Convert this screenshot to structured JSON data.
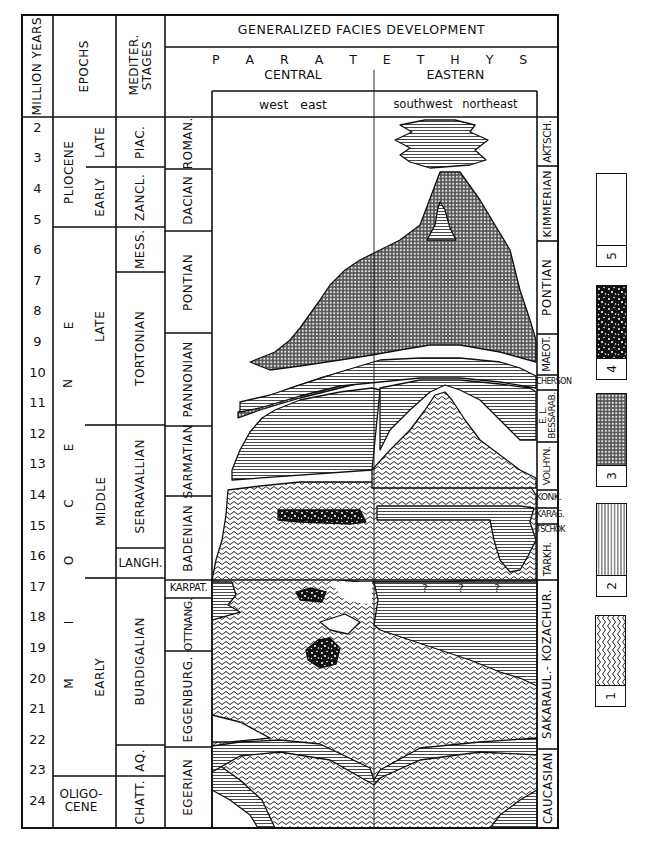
{
  "header": {
    "million_years": "MILLION YEARS",
    "epochs": "EPOCHS",
    "mediter_stages": "MEDITER. STAGES",
    "title": "GENERALIZED FACIES DEVELOPMENT",
    "paratethys": "P A R A T E T H Y S",
    "central": "CENTRAL",
    "eastern": "EASTERN",
    "central_direction": "west east",
    "eastern_direction": "southwest northeast"
  },
  "million_years": [
    "2",
    "3",
    "4",
    "5",
    "6",
    "7",
    "8",
    "9",
    "10",
    "11",
    "12",
    "13",
    "14",
    "15",
    "16",
    "17",
    "18",
    "19",
    "20",
    "21",
    "22",
    "23",
    "24"
  ],
  "epochs": {
    "pliocene": "PLIOCENE",
    "pliocene_late": "LATE",
    "pliocene_early": "EARLY",
    "miocene_letters": [
      "E",
      "N",
      "E",
      "C",
      "O",
      "I",
      "M"
    ],
    "miocene_late": "LATE",
    "miocene_middle": "MIDDLE",
    "miocene_early": "EARLY",
    "oligocene": "OLIGO-CENE"
  },
  "mediterranean_stages": [
    "PIAC.",
    "ZANCL.",
    "MESS.",
    "TORTONIAN",
    "SERRAVALLIAN",
    "LANGH.",
    "BURDIGALIAN",
    "AQ.",
    "CHATT."
  ],
  "central_paratethys_stages": [
    "ROMAN.",
    "DACIAN",
    "PONTIAN",
    "PANNONIAN",
    "SARMATIAN",
    "BADENIAN",
    "KARPAT.",
    "OTTNANG.",
    "EGGENBURG.",
    "EGERIAN"
  ],
  "eastern_paratethys_stages": [
    "AKTSCH.",
    "KIMMERIAN",
    "PONTIAN",
    "MAEOT.",
    "CHERSON",
    "E. L. BESSARAB.",
    "VOLHYN.",
    "KONK.",
    "KARAG.",
    "TSCHOK",
    "TARKH.",
    "SAKARAUL.- KOZACHUR.",
    "CAUCASIAN"
  ],
  "chart_annotations": {
    "question_marks": [
      "?",
      "?",
      "?"
    ]
  },
  "legend": [
    {
      "id": "5",
      "pattern": "blank"
    },
    {
      "id": "4",
      "pattern": "black speckled"
    },
    {
      "id": "3",
      "pattern": "dense dotted grid"
    },
    {
      "id": "2",
      "pattern": "vertical lines"
    },
    {
      "id": "1",
      "pattern": "wavy lines"
    }
  ]
}
